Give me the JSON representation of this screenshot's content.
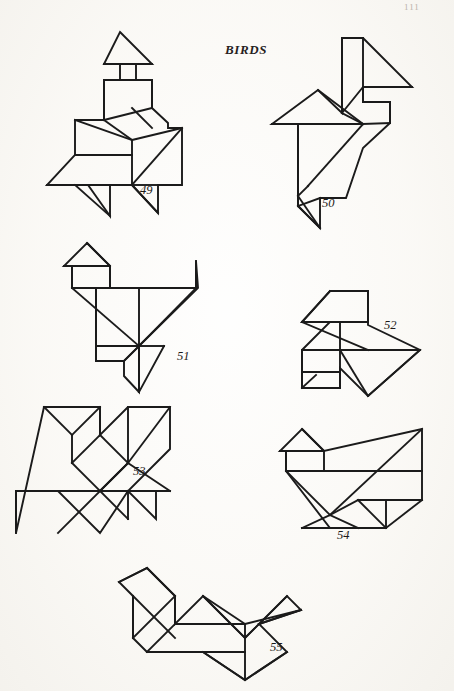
{
  "page": {
    "background_color": "#fbfaf7",
    "ink_color": "#1b1b1b",
    "page_number": "111",
    "page_number_pos": {
      "x": 404,
      "y": 2
    }
  },
  "header": {
    "title": "BIRDS",
    "title_pos": {
      "x": 225,
      "y": 42
    }
  },
  "figures": [
    {
      "id": "figure-49",
      "number_label": "49",
      "number_pos": {
        "x": 140,
        "y": 183
      },
      "caption_below": false,
      "outline_points": "120,32 152,64 136,64 136,80 152,80 152,108 168,123 168,128 182,128 182,185 158,185 158,213 132,185 110,185 110,216 88,185 47,185 75,155 75,120 104,120 104,80 120,80 120,64 104,64",
      "inner_segments": [
        "104,64 152,64",
        "104,80 152,80",
        "104,80 104,120",
        "152,80 152,108",
        "104,120 152,108",
        "132,108 152,128",
        "104,120 132,140",
        "75,120 132,140",
        "132,140 182,128",
        "132,140 132,185",
        "132,185 182,128",
        "75,155 132,155",
        "47,185 132,185",
        "75,185 110,216",
        "132,185 158,213",
        "132,185 158,185"
      ]
    },
    {
      "id": "figure-50",
      "number_label": "50",
      "number_pos": {
        "x": 322,
        "y": 196
      },
      "caption_below": false,
      "outline_points": "363,38 412,87 363,87 363,102 390,102 390,123 363,148 363,148 346,198 320,198 320,228 298,206 298,124 272,124 318,90 342,113 342,38",
      "inner_segments": [
        "342,38 342,113",
        "342,38 363,38",
        "342,113 363,87",
        "363,38 363,102",
        "363,87 412,87",
        "363,102 390,102",
        "390,102 390,123",
        "363,124 390,123",
        "342,113 363,124",
        "318,90 363,124",
        "272,124 363,124",
        "298,124 298,206",
        "363,124 308,186",
        "308,186 298,196",
        "298,196 320,228",
        "298,206 320,228",
        "320,198 298,206"
      ]
    },
    {
      "id": "figure-51",
      "number_label": "51",
      "number_pos": {
        "x": 177,
        "y": 349
      },
      "caption_below": false,
      "outline_points": "87,243 110,266 110,288 196,288 196,261 196,261 198,288 139,346 139,392 124,376 124,361 96,361 96,288 72,288 72,266 64,266",
      "inner_segments": [
        "64,266 110,266",
        "87,243 110,266",
        "72,266 72,288",
        "110,266 110,288",
        "72,288 139,288",
        "139,288 196,288",
        "139,288 139,346",
        "72,288 139,346",
        "96,288 96,361",
        "96,361 124,361",
        "139,346 124,361",
        "139,346 196,288",
        "196,288 196,261",
        "96,346 139,346",
        "124,361 139,346",
        "139,346 164,346",
        "164,346 139,392",
        "139,346 139,392"
      ]
    },
    {
      "id": "figure-52",
      "number_label": "52",
      "number_pos": {
        "x": 384,
        "y": 318
      },
      "caption_below": false,
      "outline_points": "330,291 368,291 368,325 420,350 368,396 340,368 340,388 302,388 302,350 302,350 330,322 302,322",
      "inner_segments": [
        "302,322 368,322",
        "330,291 368,291",
        "330,291 302,322",
        "368,291 368,322",
        "302,322 368,350",
        "340,322 340,350",
        "368,350 420,350",
        "302,350 368,350",
        "302,350 302,388",
        "340,350 340,388",
        "302,372 340,372",
        "340,350 368,396",
        "368,396 420,350",
        "302,388 316,375"
      ]
    },
    {
      "id": "figure-53",
      "number_label": "53",
      "number_pos": {
        "x": 133,
        "y": 464
      },
      "caption_below": false,
      "outline_points": "44,407 100,407 100,435 128,407 170,407 170,449 128,491 156,491 156,519 128,491 100,533 58,491 16,491 16,533",
      "inner_segments": [
        "44,407 100,407",
        "44,407 72,435",
        "100,407 72,435",
        "72,435 72,463",
        "72,463 100,435",
        "100,435 128,463",
        "100,491 128,463",
        "72,463 100,491",
        "100,407 100,435",
        "128,407 128,463",
        "128,463 170,407",
        "128,463 170,491",
        "100,491 170,491",
        "128,463 100,491",
        "16,491 100,491",
        "16,491 16,533",
        "100,491 128,519",
        "128,491 128,519",
        "100,491 58,533",
        "128,463 100,491"
      ]
    },
    {
      "id": "figure-54",
      "number_label": "54",
      "number_pos": {
        "x": 337,
        "y": 528
      },
      "caption_below": true,
      "outline_points": "302,429 324,451 324,451 422,429 422,471 422,500 386,500 386,528 330,528 330,528 286,471 286,451 280,451",
      "inner_segments": [
        "280,451 324,451",
        "302,429 324,451",
        "286,451 286,471",
        "324,451 324,471",
        "286,471 422,471",
        "286,471 330,515",
        "330,515 422,429",
        "358,500 422,500",
        "358,500 386,528",
        "386,528 422,500",
        "330,515 358,500",
        "302,528 386,528",
        "302,528 330,515",
        "330,515 358,528"
      ]
    },
    {
      "id": "figure-55",
      "number_label": "55",
      "number_pos": {
        "x": 270,
        "y": 640
      },
      "caption_below": false,
      "outline_points": "147,568 175,596 175,624 203,596 245,638 245,638 287,596 301,610 259,624 287,652 245,680 203,652 147,652 133,638 133,596 119,582",
      "inner_segments": [
        "119,582 147,568",
        "147,568 175,596",
        "133,596 175,638",
        "133,638 175,596",
        "175,596 175,624",
        "133,596 133,638",
        "147,652 175,624",
        "147,652 245,652",
        "175,624 245,624",
        "203,596 245,638",
        "203,596 245,624",
        "245,638 287,596",
        "245,624 301,610",
        "259,624 301,610",
        "245,680 287,652",
        "245,680 203,652",
        "245,624 245,680"
      ]
    }
  ]
}
